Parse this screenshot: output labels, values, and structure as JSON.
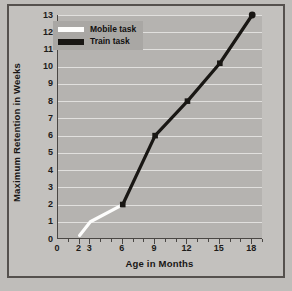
{
  "chart_data": {
    "type": "line",
    "title": "",
    "xlabel": "Age in Months",
    "ylabel": "Maximum Retention in Weeks",
    "xlim": [
      0,
      19
    ],
    "ylim": [
      0,
      13
    ],
    "grid": true,
    "legend_position": "top-left",
    "x_ticks": [
      0,
      2,
      3,
      6,
      9,
      12,
      15,
      18
    ],
    "x_tick_labels": [
      "0",
      "2",
      "3",
      "6",
      "9",
      "12",
      "15",
      "18"
    ],
    "x_minor_ticks": [
      1,
      2,
      3,
      4,
      5,
      6,
      7,
      8,
      9,
      10,
      11,
      12,
      13,
      14,
      15,
      16,
      17,
      18,
      19
    ],
    "y_ticks": [
      0,
      1,
      2,
      3,
      4,
      5,
      6,
      7,
      8,
      9,
      10,
      11,
      12,
      13
    ],
    "y_tick_labels": [
      "0",
      "1",
      "2",
      "3",
      "4",
      "5",
      "6",
      "7",
      "8",
      "9",
      "10",
      "11",
      "12",
      "13"
    ],
    "series": [
      {
        "name": "Mobile task",
        "color": "#fdfdfc",
        "marker": "none",
        "points": [
          {
            "x": 2,
            "y": 0.2
          },
          {
            "x": 3,
            "y": 1.0
          },
          {
            "x": 6,
            "y": 2.0
          }
        ]
      },
      {
        "name": "Train task",
        "color": "#191714",
        "marker": "square",
        "points": [
          {
            "x": 6,
            "y": 2.0
          },
          {
            "x": 9,
            "y": 6.0
          },
          {
            "x": 12,
            "y": 8.0
          },
          {
            "x": 15,
            "y": 10.2
          },
          {
            "x": 18,
            "y": 13.0
          }
        ]
      }
    ]
  },
  "legend": {
    "items": [
      {
        "label": "Mobile task",
        "color": "#fdfdfc"
      },
      {
        "label": "Train task",
        "color": "#191714"
      }
    ]
  },
  "axes": {
    "x_title": "Age in Months",
    "y_title": "Maximum Retention in Weeks"
  }
}
